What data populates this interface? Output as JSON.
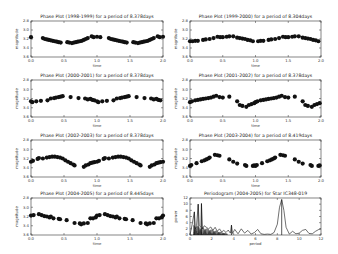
{
  "chart_data": [
    {
      "type": "scatter",
      "title": "Phase Plot (1998-1999) for a period of 8.378days",
      "xlabel": "time",
      "ylabel": "magnitude",
      "xlim": [
        0.0,
        2.0
      ],
      "ylim": [
        2.8,
        3.6
      ],
      "y_inverted": true,
      "xticks": [
        "0.0",
        "0.5",
        "1.0",
        "1.5",
        "2.0"
      ],
      "yticks": [
        "2.8",
        "3.0",
        "3.2",
        "3.4",
        "3.6"
      ],
      "x": [
        0.0,
        0.18,
        0.21,
        0.24,
        0.27,
        0.3,
        0.33,
        0.36,
        0.39,
        0.42,
        0.45,
        0.55,
        0.58,
        0.62,
        0.65,
        0.68,
        0.71,
        0.74,
        0.77,
        0.8,
        0.83,
        0.86,
        0.92,
        0.95,
        1.0,
        1.05,
        1.18,
        1.21,
        1.24,
        1.27,
        1.3,
        1.33,
        1.36,
        1.39,
        1.42,
        1.45,
        1.55,
        1.58,
        1.62,
        1.65,
        1.68,
        1.71,
        1.74,
        1.77,
        1.8,
        1.83,
        1.86,
        1.92,
        1.95,
        2.0
      ],
      "y": [
        3.16,
        3.18,
        3.2,
        3.21,
        3.22,
        3.23,
        3.24,
        3.25,
        3.26,
        3.27,
        3.28,
        3.27,
        3.28,
        3.29,
        3.28,
        3.27,
        3.26,
        3.25,
        3.24,
        3.22,
        3.2,
        3.18,
        3.14,
        3.16,
        3.15,
        3.16,
        3.18,
        3.2,
        3.21,
        3.22,
        3.23,
        3.24,
        3.25,
        3.26,
        3.27,
        3.28,
        3.27,
        3.28,
        3.29,
        3.28,
        3.27,
        3.26,
        3.25,
        3.24,
        3.22,
        3.2,
        3.18,
        3.14,
        3.16,
        3.15
      ]
    },
    {
      "type": "scatter",
      "title": "Phase Plot (1999-2000) for a period of 8.304days",
      "xlabel": "time",
      "ylabel": "magnitude",
      "xlim": [
        0.0,
        2.0
      ],
      "ylim": [
        2.8,
        3.6
      ],
      "y_inverted": true,
      "xticks": [
        "0.0",
        "0.5",
        "1.0",
        "1.5",
        "2.0"
      ],
      "yticks": [
        "2.8",
        "3.0",
        "3.2",
        "3.4",
        "3.6"
      ],
      "x": [
        0.0,
        0.04,
        0.08,
        0.12,
        0.2,
        0.24,
        0.3,
        0.36,
        0.42,
        0.46,
        0.5,
        0.56,
        0.6,
        0.66,
        0.72,
        0.76,
        0.8,
        0.84,
        0.88,
        0.92,
        0.96,
        1.04,
        1.08,
        1.12,
        1.2,
        1.24,
        1.3,
        1.36,
        1.42,
        1.46,
        1.5,
        1.56,
        1.6,
        1.66,
        1.72,
        1.76,
        1.8,
        1.84,
        1.88,
        1.92,
        1.96
      ],
      "y": [
        3.25,
        3.25,
        3.24,
        3.24,
        3.22,
        3.21,
        3.2,
        3.18,
        3.15,
        3.16,
        3.16,
        3.15,
        3.14,
        3.14,
        3.17,
        3.18,
        3.19,
        3.2,
        3.22,
        3.23,
        3.25,
        3.25,
        3.24,
        3.24,
        3.22,
        3.21,
        3.2,
        3.18,
        3.15,
        3.16,
        3.16,
        3.15,
        3.14,
        3.14,
        3.17,
        3.18,
        3.19,
        3.2,
        3.22,
        3.23,
        3.25
      ]
    },
    {
      "type": "scatter",
      "title": "Phase Plot (2000-2001) for a period of 8.378days",
      "xlabel": "time",
      "ylabel": "magnitude",
      "xlim": [
        0.0,
        2.0
      ],
      "ylim": [
        2.8,
        3.6
      ],
      "y_inverted": true,
      "xticks": [
        "0.0",
        "0.5",
        "1.0",
        "1.5",
        "2.0"
      ],
      "yticks": [
        "2.8",
        "3.0",
        "3.2",
        "3.4",
        "3.6"
      ],
      "x": [
        0.0,
        0.02,
        0.08,
        0.15,
        0.25,
        0.3,
        0.35,
        0.38,
        0.42,
        0.45,
        0.48,
        0.6,
        0.72,
        0.82,
        0.86,
        0.9,
        0.93,
        0.96,
        1.0,
        1.02,
        1.08,
        1.15,
        1.25,
        1.3,
        1.35,
        1.38,
        1.42,
        1.45,
        1.48,
        1.6,
        1.72,
        1.82,
        1.86,
        1.9,
        1.93,
        1.96
      ],
      "y": [
        3.26,
        3.28,
        3.26,
        3.25,
        3.24,
        3.2,
        3.19,
        3.18,
        3.17,
        3.16,
        3.15,
        3.17,
        3.19,
        3.2,
        3.22,
        3.21,
        3.23,
        3.24,
        3.26,
        3.28,
        3.26,
        3.25,
        3.24,
        3.2,
        3.19,
        3.18,
        3.17,
        3.16,
        3.15,
        3.17,
        3.19,
        3.2,
        3.22,
        3.21,
        3.23,
        3.24
      ]
    },
    {
      "type": "scatter",
      "title": "Phase Plot (2001-2002) for a period of 8.378days",
      "xlabel": "time",
      "ylabel": "magnitude",
      "xlim": [
        0.0,
        2.0
      ],
      "ylim": [
        2.8,
        3.6
      ],
      "y_inverted": true,
      "xticks": [
        "0.0",
        "0.5",
        "1.0",
        "1.5",
        "2.0"
      ],
      "yticks": [
        "2.8",
        "3.0",
        "3.2",
        "3.4",
        "3.6"
      ],
      "x": [
        0.0,
        0.03,
        0.08,
        0.12,
        0.16,
        0.2,
        0.24,
        0.28,
        0.32,
        0.36,
        0.4,
        0.45,
        0.5,
        0.6,
        0.72,
        0.76,
        0.8,
        0.86,
        0.9,
        0.94,
        0.98,
        1.0,
        1.03,
        1.08,
        1.12,
        1.16,
        1.2,
        1.24,
        1.28,
        1.32,
        1.36,
        1.4,
        1.45,
        1.5,
        1.6,
        1.72,
        1.76,
        1.8,
        1.86,
        1.9,
        1.94,
        1.98
      ],
      "y": [
        3.28,
        3.26,
        3.24,
        3.23,
        3.22,
        3.21,
        3.2,
        3.19,
        3.18,
        3.16,
        3.14,
        3.17,
        3.18,
        3.16,
        3.26,
        3.34,
        3.36,
        3.38,
        3.34,
        3.32,
        3.3,
        3.28,
        3.26,
        3.24,
        3.23,
        3.22,
        3.21,
        3.2,
        3.19,
        3.18,
        3.16,
        3.14,
        3.17,
        3.18,
        3.16,
        3.26,
        3.34,
        3.36,
        3.38,
        3.34,
        3.32,
        3.3
      ]
    },
    {
      "type": "scatter",
      "title": "Phase Plot (2002-2003) for a period of 8.378days",
      "xlabel": "time",
      "ylabel": "magnitude",
      "xlim": [
        0.0,
        2.0
      ],
      "ylim": [
        2.8,
        3.6
      ],
      "y_inverted": true,
      "xticks": [
        "0.0",
        "0.5",
        "1.0",
        "1.5",
        "2.0"
      ],
      "yticks": [
        "2.8",
        "3.0",
        "3.2",
        "3.4",
        "3.6"
      ],
      "x": [
        0.0,
        0.03,
        0.1,
        0.12,
        0.18,
        0.24,
        0.28,
        0.32,
        0.36,
        0.4,
        0.44,
        0.48,
        0.52,
        0.56,
        0.6,
        0.64,
        0.66,
        0.8,
        0.83,
        0.87,
        0.9,
        0.93,
        0.96,
        1.0,
        1.03,
        1.1,
        1.12,
        1.18,
        1.24,
        1.28,
        1.32,
        1.36,
        1.4,
        1.44,
        1.48,
        1.52,
        1.56,
        1.6,
        1.64,
        1.66,
        1.8,
        1.83,
        1.87,
        1.9,
        1.93,
        1.96,
        2.0
      ],
      "y": [
        3.27,
        3.25,
        3.21,
        3.19,
        3.2,
        3.18,
        3.17,
        3.16,
        3.16,
        3.17,
        3.18,
        3.2,
        3.24,
        3.27,
        3.3,
        3.33,
        3.35,
        3.38,
        3.35,
        3.33,
        3.3,
        3.29,
        3.28,
        3.27,
        3.25,
        3.21,
        3.19,
        3.2,
        3.18,
        3.17,
        3.16,
        3.16,
        3.17,
        3.18,
        3.2,
        3.24,
        3.27,
        3.3,
        3.33,
        3.35,
        3.38,
        3.35,
        3.33,
        3.3,
        3.29,
        3.28,
        3.27
      ]
    },
    {
      "type": "scatter",
      "title": "Phase Plot (2003-2004) for a period of 8.419days",
      "xlabel": "time",
      "ylabel": "magnitude",
      "xlim": [
        0.0,
        2.0
      ],
      "ylim": [
        2.8,
        3.6
      ],
      "y_inverted": true,
      "xticks": [
        "0.0",
        "0.5",
        "1.0",
        "1.5",
        "2.0"
      ],
      "yticks": [
        "2.8",
        "3.0",
        "3.2",
        "3.4",
        "3.6"
      ],
      "x": [
        0.0,
        0.02,
        0.1,
        0.18,
        0.22,
        0.25,
        0.28,
        0.3,
        0.38,
        0.42,
        0.45,
        0.6,
        0.66,
        0.72,
        0.84,
        0.86,
        0.96,
        0.98,
        1.0,
        1.02,
        1.1,
        1.18,
        1.22,
        1.25,
        1.28,
        1.3,
        1.38,
        1.42,
        1.45,
        1.6,
        1.66,
        1.72,
        1.84,
        1.86,
        1.96,
        1.98
      ],
      "y": [
        3.36,
        3.34,
        3.3,
        3.26,
        3.24,
        3.22,
        3.2,
        3.18,
        3.12,
        3.13,
        3.14,
        3.22,
        3.27,
        3.31,
        3.34,
        3.36,
        3.36,
        3.35,
        3.36,
        3.34,
        3.3,
        3.26,
        3.24,
        3.22,
        3.2,
        3.18,
        3.12,
        3.13,
        3.14,
        3.22,
        3.27,
        3.31,
        3.34,
        3.36,
        3.36,
        3.35
      ]
    },
    {
      "type": "scatter",
      "title": "Phase Plot (2004-2005) for a period of 8.445days",
      "xlabel": "time",
      "ylabel": "magnitude",
      "xlim": [
        0.0,
        2.0
      ],
      "ylim": [
        2.8,
        3.6
      ],
      "y_inverted": true,
      "xticks": [
        "0.0",
        "0.5",
        "1.0",
        "1.5",
        "2.0"
      ],
      "yticks": [
        "2.8",
        "3.0",
        "3.2",
        "3.4",
        "3.6"
      ],
      "x": [
        0.0,
        0.04,
        0.12,
        0.16,
        0.2,
        0.24,
        0.28,
        0.3,
        0.34,
        0.42,
        0.44,
        0.54,
        0.66,
        0.74,
        0.76,
        0.8,
        0.86,
        0.9,
        0.94,
        0.98,
        1.0,
        1.04,
        1.12,
        1.16,
        1.2,
        1.24,
        1.28,
        1.3,
        1.34,
        1.42,
        1.44,
        1.54,
        1.66,
        1.74,
        1.76,
        1.8,
        1.86,
        1.9,
        1.94,
        1.98,
        2.0
      ],
      "y": [
        3.18,
        3.17,
        3.15,
        3.17,
        3.19,
        3.2,
        3.22,
        3.2,
        3.24,
        3.25,
        3.26,
        3.28,
        3.34,
        3.35,
        3.37,
        3.35,
        3.34,
        3.24,
        3.24,
        3.22,
        3.18,
        3.17,
        3.15,
        3.17,
        3.19,
        3.2,
        3.22,
        3.2,
        3.24,
        3.25,
        3.26,
        3.28,
        3.34,
        3.35,
        3.37,
        3.35,
        3.34,
        3.24,
        3.24,
        3.22,
        3.18
      ]
    },
    {
      "type": "line",
      "title": "Periodogram (2004-2005) for Star IC348-019",
      "xlabel": "period",
      "ylabel": "power",
      "xlim": [
        0,
        12
      ],
      "ylim": [
        0,
        12
      ],
      "xticks": [
        "0",
        "2",
        "4",
        "6",
        "8",
        "10",
        "12"
      ],
      "yticks": [
        "0",
        "2",
        "4",
        "6",
        "8",
        "10",
        "12"
      ],
      "peaks": [
        {
          "x": 0.4,
          "y": 7.5
        },
        {
          "x": 0.75,
          "y": 10.0
        },
        {
          "x": 1.05,
          "y": 10.2
        },
        {
          "x": 3.8,
          "y": 3.2
        },
        {
          "x": 8.4,
          "y": 11.5
        }
      ],
      "x": [
        0,
        0.2,
        0.4,
        0.5,
        0.6,
        0.75,
        0.85,
        1.0,
        1.05,
        1.15,
        1.3,
        1.5,
        1.7,
        1.9,
        2.1,
        2.3,
        2.5,
        2.7,
        2.9,
        3.1,
        3.3,
        3.5,
        3.7,
        3.8,
        3.9,
        4.1,
        4.4,
        4.7,
        5.0,
        5.3,
        5.6,
        5.9,
        6.2,
        6.5,
        6.8,
        7.1,
        7.4,
        7.7,
        8.0,
        8.2,
        8.4,
        8.6,
        8.8,
        9.1,
        9.4,
        9.7,
        10.0,
        10.3,
        10.6,
        10.9,
        11.2,
        11.5,
        11.8,
        12.0
      ],
      "y": [
        0,
        3.5,
        7.5,
        2.0,
        3.0,
        10.0,
        3.0,
        2.5,
        10.2,
        2.0,
        3.0,
        2.5,
        2.0,
        2.6,
        1.5,
        2.5,
        1.2,
        2.0,
        1.0,
        1.5,
        0.8,
        1.6,
        0.6,
        3.2,
        0.5,
        1.8,
        0.4,
        2.0,
        0.6,
        1.5,
        0.3,
        0.8,
        1.8,
        0.4,
        0.2,
        0.3,
        0.2,
        0.8,
        3.5,
        9.0,
        11.5,
        8.0,
        2.5,
        0.3,
        1.2,
        0.4,
        0.6,
        1.5,
        1.8,
        0.5,
        0.4,
        1.2,
        1.8,
        2.0
      ]
    }
  ]
}
